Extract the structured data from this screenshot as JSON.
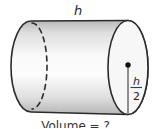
{
  "figure": {
    "type": "cylinder-diagram",
    "height_label": "h",
    "radius_label": {
      "numerator": "h",
      "denominator": "2"
    },
    "caption": "Volume = ?"
  },
  "colors": {
    "background": "#ffffff",
    "outline": "#2b2b2b",
    "body_shadow_top": "#b8b8b8",
    "body_mid_light": "#fafafa",
    "body_shadow_bottom": "#b5b5b5",
    "face_fill": "#f7f7f7",
    "dot": "#111111"
  }
}
